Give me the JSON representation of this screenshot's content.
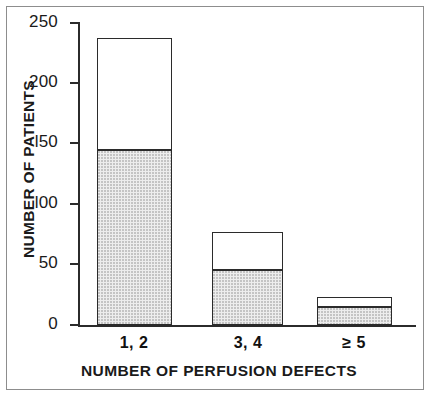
{
  "chart_data": {
    "type": "bar",
    "title": "",
    "subtitle": "",
    "xlabel": "NUMBER OF PERFUSION DEFECTS",
    "ylabel": "NUMBER OF PATIENTS",
    "categories": [
      "1, 2",
      "3, 4",
      "≥ 5"
    ],
    "stacked": true,
    "series": [
      {
        "name": "shaded",
        "values": [
          144,
          45,
          15
        ]
      },
      {
        "name": "open",
        "values": [
          93,
          32,
          8
        ]
      }
    ],
    "totals": [
      237,
      77,
      23
    ],
    "ylim": [
      0,
      250
    ],
    "yticks": [
      0,
      50,
      100,
      150,
      200,
      250
    ],
    "yticklabels": [
      "0",
      "50",
      "l00",
      "l50",
      "200",
      "250"
    ],
    "grid": false,
    "legend": "none",
    "colors": {
      "shaded_fill": "#ededed",
      "shaded_stipple": "#c4c4c4",
      "open_fill": "#ffffff",
      "outline": "#2b2b2b",
      "axis": "#2b2b2b",
      "frame": "#8d8d8d",
      "text": "#1a1a1a"
    }
  }
}
